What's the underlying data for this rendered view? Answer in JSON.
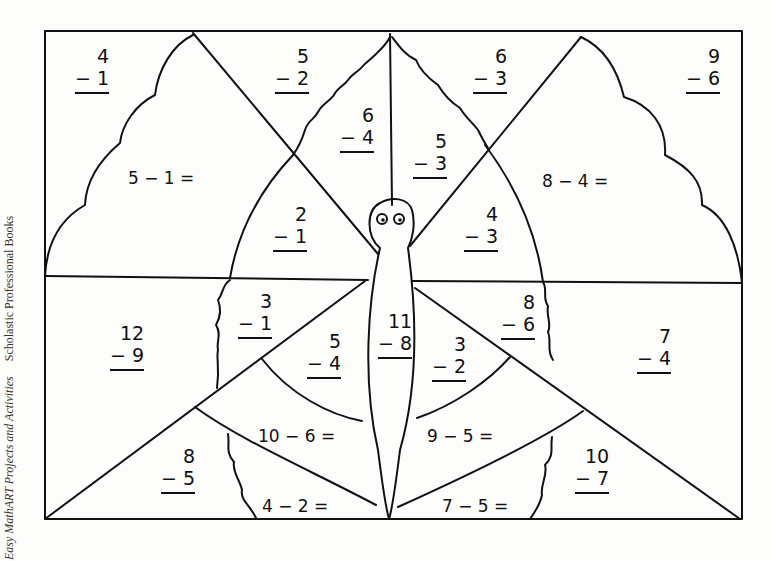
{
  "side_caption": {
    "book": "Easy MathART Projects and Activities",
    "publisher": "Scholastic Professional Books"
  },
  "vertical_problems": [
    {
      "id": "p1",
      "top": "4",
      "bottom": "− 1",
      "x": 75,
      "y": 45
    },
    {
      "id": "p2",
      "top": "5",
      "bottom": "− 2",
      "x": 275,
      "y": 45
    },
    {
      "id": "p3",
      "top": "6",
      "bottom": "− 3",
      "x": 473,
      "y": 45
    },
    {
      "id": "p4",
      "top": "9",
      "bottom": "− 6",
      "x": 686,
      "y": 45
    },
    {
      "id": "p5",
      "top": "6",
      "bottom": "− 4",
      "x": 340,
      "y": 104
    },
    {
      "id": "p6",
      "top": "5",
      "bottom": "− 3",
      "x": 413,
      "y": 130
    },
    {
      "id": "p7",
      "top": "2",
      "bottom": "− 1",
      "x": 273,
      "y": 203
    },
    {
      "id": "p8",
      "top": "4",
      "bottom": "− 3",
      "x": 464,
      "y": 203
    },
    {
      "id": "p9",
      "top": "3",
      "bottom": "− 1",
      "x": 238,
      "y": 290
    },
    {
      "id": "p10",
      "top": "8",
      "bottom": "− 6",
      "x": 501,
      "y": 291
    },
    {
      "id": "p11",
      "top": "12",
      "bottom": "− 9",
      "x": 110,
      "y": 322
    },
    {
      "id": "p12",
      "top": "11",
      "bottom": "− 8",
      "x": 378,
      "y": 310
    },
    {
      "id": "p13",
      "top": "5",
      "bottom": "− 4",
      "x": 307,
      "y": 330
    },
    {
      "id": "p14",
      "top": "3",
      "bottom": "− 2",
      "x": 432,
      "y": 333
    },
    {
      "id": "p15",
      "top": "7",
      "bottom": "− 4",
      "x": 637,
      "y": 325
    },
    {
      "id": "p16",
      "top": "8",
      "bottom": "− 5",
      "x": 161,
      "y": 445
    },
    {
      "id": "p17",
      "top": "10",
      "bottom": "− 7",
      "x": 575,
      "y": 445
    }
  ],
  "horizontal_equations": [
    {
      "id": "e1",
      "text": "5 − 1 =",
      "x": 128,
      "y": 168
    },
    {
      "id": "e2",
      "text": "8 − 4 =",
      "x": 542,
      "y": 171
    },
    {
      "id": "e3",
      "text": "10 − 6 =",
      "x": 258,
      "y": 426
    },
    {
      "id": "e4",
      "text": "9 − 5 =",
      "x": 427,
      "y": 426
    },
    {
      "id": "e5",
      "text": "4 − 2 =",
      "x": 262,
      "y": 496
    },
    {
      "id": "e6",
      "text": "7 − 5 =",
      "x": 442,
      "y": 496
    }
  ]
}
